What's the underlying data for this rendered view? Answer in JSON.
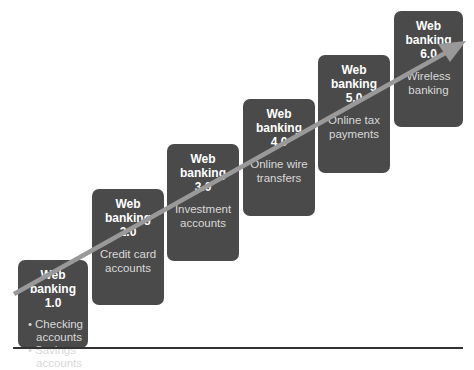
{
  "diagram": {
    "stages": [
      {
        "title": "Web banking 1.0",
        "title_line1": "Web",
        "title_line2": "banking",
        "title_line3": "1.0",
        "items": [
          "Checking accounts",
          "Savings accounts"
        ]
      },
      {
        "title_line1": "Web",
        "title_line2": "banking",
        "title_line3": "2.0",
        "desc": "Credit card accounts"
      },
      {
        "title_line1": "Web",
        "title_line2": "banking",
        "title_line3": "3.0",
        "desc": "Investment accounts"
      },
      {
        "title_line1": "Web",
        "title_line2": "banking",
        "title_line3": "4.0",
        "desc": "Online wire transfers"
      },
      {
        "title_line1": "Web",
        "title_line2": "banking",
        "title_line3": "5.0",
        "desc": "Online tax payments"
      },
      {
        "title_line1": "Web",
        "title_line2": "banking",
        "title_line3": "6.0",
        "desc": "Wireless banking"
      }
    ],
    "colors": {
      "box": "#4a4a4a",
      "arrow": "#999999",
      "title": "#ffffff",
      "text": "#d9d9d9"
    }
  }
}
